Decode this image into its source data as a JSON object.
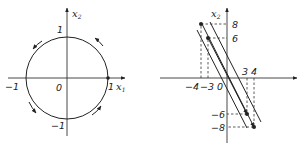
{
  "figures": [
    {
      "id": "unit-circle",
      "axis_x": {
        "label": "x",
        "sub": "1"
      },
      "axis_y": {
        "label": "x",
        "sub": "2"
      },
      "ticks": {
        "x_neg": "−1",
        "x_pos": "1",
        "y_pos": "1",
        "y_neg": "−1",
        "origin": "0"
      },
      "circle": {
        "center": [
          0,
          0
        ],
        "radius": 1,
        "direction": "counterclockwise"
      },
      "marked_point": [
        1,
        0
      ]
    },
    {
      "id": "parallel-lines",
      "axis_y": {
        "label": "x",
        "sub": "2"
      },
      "ticks": {
        "x": [
          "−4",
          "−3",
          "3",
          "4"
        ],
        "y": [
          "8",
          "6",
          "−6",
          "−8"
        ],
        "origin": "0"
      },
      "points": [
        [
          -4,
          8
        ],
        [
          -3,
          6
        ],
        [
          3,
          -6
        ],
        [
          4,
          -8
        ]
      ],
      "lines": "three parallel lines of slope −2 with arrows",
      "dashed_projections": true
    }
  ]
}
